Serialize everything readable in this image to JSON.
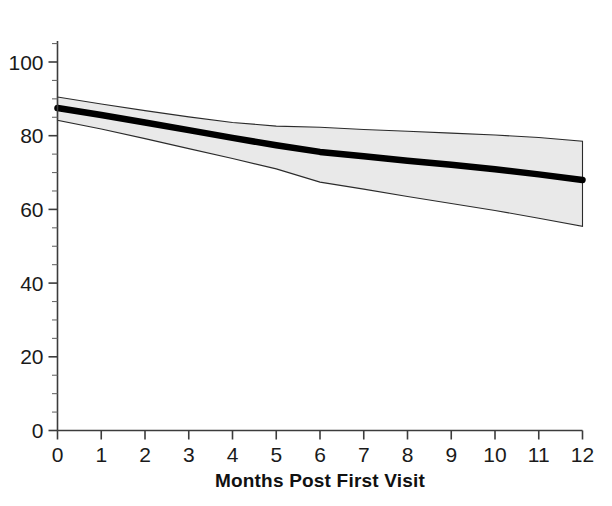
{
  "chart_data": {
    "type": "line",
    "title": "",
    "subtitle": "",
    "xlabel": "Months Post First Visit",
    "ylabel": "",
    "x": [
      0,
      1,
      2,
      3,
      4,
      5,
      6,
      7,
      8,
      9,
      10,
      11,
      12
    ],
    "xlim": [
      0,
      12
    ],
    "ylim": [
      0,
      105
    ],
    "y_axis_visible_max": 105,
    "grid": false,
    "legend": null,
    "x_tick_labels": [
      "0",
      "1",
      "2",
      "3",
      "4",
      "5",
      "6",
      "7",
      "8",
      "9",
      "10",
      "11",
      "12"
    ],
    "y_tick_labels": [
      "0",
      "20",
      "40",
      "60",
      "80",
      "100"
    ],
    "y_ticks": [
      0,
      20,
      40,
      60,
      80,
      100
    ],
    "y_minor_tick_step": 5,
    "series": [
      {
        "name": "mean",
        "style": "thick-black-line",
        "values": [
          87.5,
          85.6,
          83.6,
          81.5,
          79.4,
          77.4,
          75.6,
          74.4,
          73.2,
          72.1,
          70.9,
          69.5,
          68.0
        ]
      },
      {
        "name": "confidence-band-upper",
        "style": "light-gray-fill-boundary",
        "values": [
          90.5,
          88.6,
          86.8,
          85.1,
          83.6,
          82.6,
          82.3,
          81.7,
          81.2,
          80.7,
          80.2,
          79.5,
          78.5
        ]
      },
      {
        "name": "confidence-band-lower",
        "style": "light-gray-fill-boundary",
        "values": [
          84.2,
          81.8,
          79.2,
          76.5,
          73.8,
          71.0,
          67.4,
          65.5,
          63.5,
          61.6,
          59.7,
          57.6,
          55.4
        ]
      }
    ],
    "colors": {
      "mean_line": "#000000",
      "band_fill": "#e9e9e9",
      "band_edge": "#2b2b2b",
      "axis": "#3c3c3c",
      "text": "#111111",
      "background": "#ffffff"
    },
    "annotations": []
  },
  "axes": {
    "x_title": "Months Post First Visit"
  }
}
